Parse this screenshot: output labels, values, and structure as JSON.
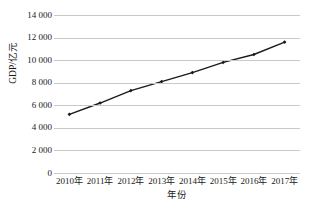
{
  "chart_data": {
    "type": "line",
    "title": "",
    "xlabel": "年份",
    "ylabel": "GDP/亿元",
    "categories": [
      "2010年",
      "2011年",
      "2012年",
      "2013年",
      "2014年",
      "2015年",
      "2016年",
      "2017年"
    ],
    "values": [
      5200,
      6200,
      7300,
      8100,
      8900,
      9800,
      10500,
      11600
    ],
    "series": [
      {
        "name": "GDP",
        "values": [
          5200,
          6200,
          7300,
          8100,
          8900,
          9800,
          10500,
          11600
        ]
      }
    ],
    "ylim": [
      0,
      14000
    ],
    "y_ticks": [
      0,
      2000,
      4000,
      6000,
      8000,
      10000,
      12000,
      14000
    ],
    "y_tick_labels": [
      "0",
      "2 000",
      "4 000",
      "6 000",
      "8 000",
      "10 000",
      "12 000",
      "14 000"
    ],
    "grid": true,
    "legend": "none",
    "line_color": "#1a1a1a",
    "marker": "diamond",
    "grid_color": "#c9c9c9"
  }
}
